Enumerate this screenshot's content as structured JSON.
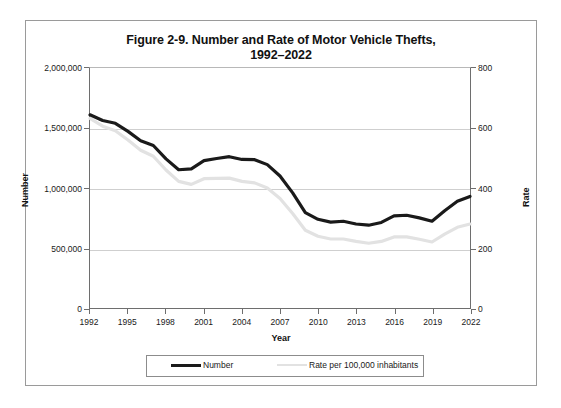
{
  "figure": {
    "title_line1": "Figure 2-9. Number and Rate of Motor Vehicle Thefts,",
    "title_line2": "1992–2022"
  },
  "axes": {
    "xlabel": "Year",
    "ylabel_left": "Number",
    "ylabel_right": "Rate",
    "y_left_ticks": [
      "0",
      "500,000",
      "1,000,000",
      "1,500,000",
      "2,000,000"
    ],
    "y_right_ticks": [
      "0",
      "200",
      "400",
      "600",
      "800"
    ],
    "x_ticks": [
      "1992",
      "1995",
      "1998",
      "2001",
      "2004",
      "2007",
      "2010",
      "2013",
      "2016",
      "2019",
      "2022"
    ]
  },
  "legend": {
    "number_label": "Number",
    "rate_label": "Rate per 100,000 inhabitants"
  },
  "colors": {
    "number_line": "#1a1a1a",
    "rate_line": "#e2e2e2",
    "gridline": "#cfcfcf",
    "frame": "#9a9a9a",
    "axis": "#6e6e6e"
  },
  "chart_data": {
    "type": "line",
    "title": "Figure 2-9. Number and Rate of Motor Vehicle Thefts, 1992–2022",
    "xlabel": "Year",
    "ylabel": "Number",
    "ylabel_secondary": "Rate",
    "grid": true,
    "legend_position": "bottom",
    "xlim": [
      1992,
      2022
    ],
    "ylim": [
      0,
      2000000
    ],
    "ylim_secondary": [
      0,
      800
    ],
    "x": [
      1992,
      1993,
      1994,
      1995,
      1996,
      1997,
      1998,
      1999,
      2000,
      2001,
      2002,
      2003,
      2004,
      2005,
      2006,
      2007,
      2008,
      2009,
      2010,
      2011,
      2012,
      2013,
      2014,
      2015,
      2016,
      2017,
      2018,
      2019,
      2020,
      2021,
      2022
    ],
    "series": [
      {
        "name": "Number",
        "axis": "left",
        "values": [
          1610000,
          1563000,
          1539000,
          1472000,
          1394000,
          1354000,
          1243000,
          1152000,
          1160000,
          1228000,
          1246000,
          1261000,
          1238000,
          1236000,
          1195000,
          1100000,
          959000,
          795000,
          739000,
          716000,
          723000,
          700000,
          690000,
          713000,
          767000,
          773000,
          751000,
          723000,
          811000,
          890000,
          930000
        ]
      },
      {
        "name": "Rate per 100,000 inhabitants",
        "axis": "right",
        "values": [
          632,
          606,
          591,
          560,
          526,
          506,
          460,
          422,
          412,
          431,
          432,
          433,
          422,
          417,
          400,
          365,
          315,
          259,
          239,
          230,
          230,
          222,
          216,
          222,
          237,
          237,
          229,
          220,
          246,
          269,
          280
        ]
      }
    ]
  }
}
